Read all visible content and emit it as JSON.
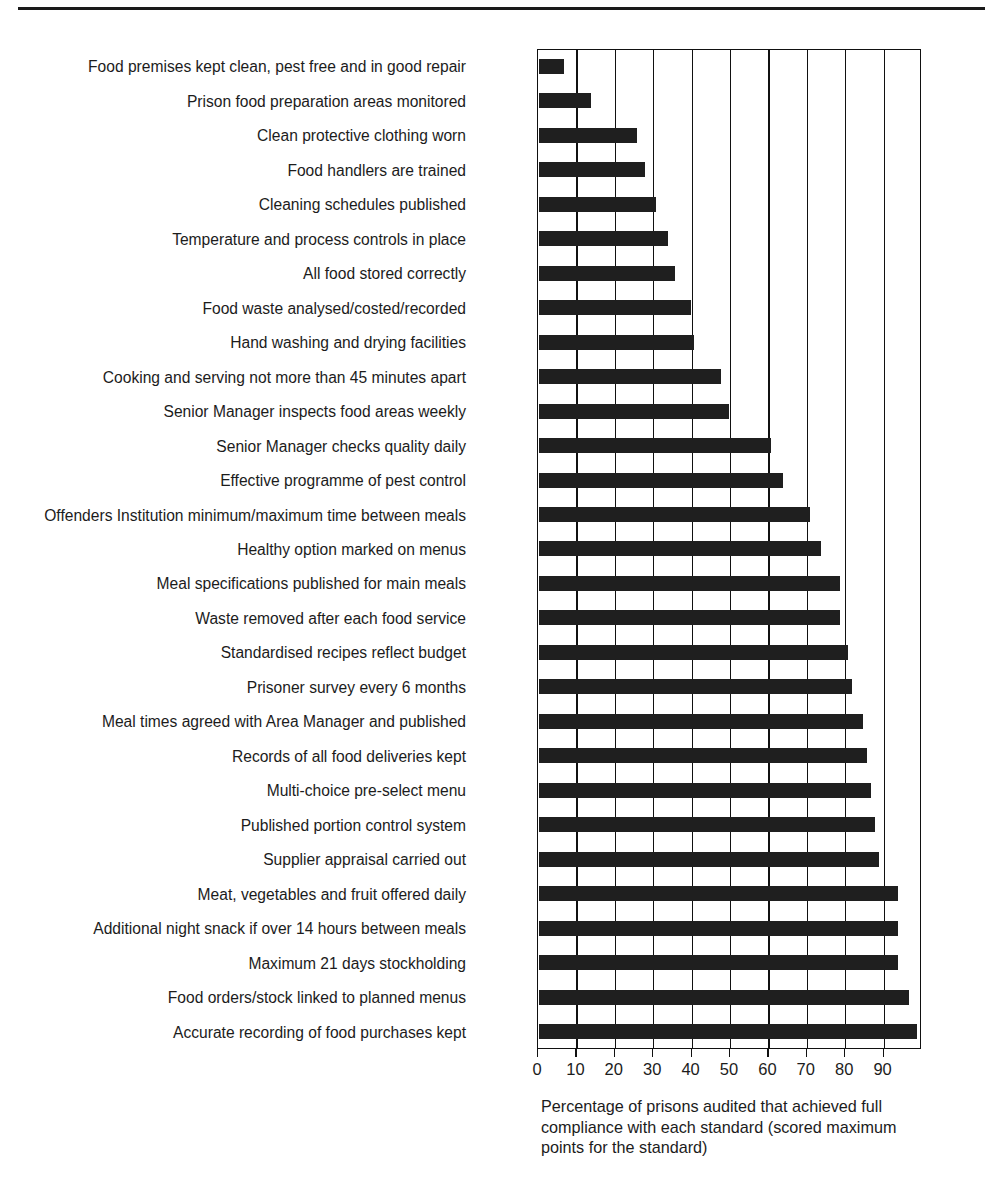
{
  "chart_data": {
    "type": "bar",
    "orientation": "horizontal",
    "title": "",
    "subtitle": "",
    "xlabel": "Percentage of prisons audited that achieved full compliance with each standard (scored maximum points for the standard)",
    "ylabel": "",
    "xlim": [
      0,
      100
    ],
    "xticks": [
      0,
      10,
      20,
      30,
      40,
      50,
      60,
      70,
      80,
      90
    ],
    "xtick_labels": [
      "0",
      "10",
      "20",
      "30",
      "40",
      "50",
      "60",
      "70",
      "80",
      "90"
    ],
    "grid": "vertical",
    "legend": "none",
    "bar_color": "#1f1f1f",
    "categories": [
      "Food premises kept clean, pest free and in good repair",
      "Prison food preparation areas monitored",
      "Clean protective clothing worn",
      "Food handlers are trained",
      "Cleaning schedules published",
      "Temperature and process controls in place",
      "All food stored correctly",
      "Food waste analysed/costed/recorded",
      "Hand washing and drying facilities",
      "Cooking and serving not more than 45 minutes apart",
      "Senior Manager inspects food areas weekly",
      "Senior Manager checks quality daily",
      "Effective programme of pest control",
      "Offenders Institution minimum/maximum time between meals",
      "Healthy option marked on menus",
      "Meal specifications published for main meals",
      "Waste removed after each food service",
      "Standardised recipes reflect budget",
      "Prisoner survey every 6 months",
      "Meal times agreed with Area Manager and published",
      "Records of all food deliveries kept",
      "Multi-choice pre-select menu",
      "Published portion control system",
      "Supplier appraisal carried out",
      "Meat, vegetables and fruit offered daily",
      "Additional night snack if over 14 hours between meals",
      "Maximum 21 days stockholding",
      "Food orders/stock linked to planned menus",
      "Accurate recording of food purchases kept"
    ],
    "values": [
      7,
      14,
      26,
      28,
      31,
      34,
      36,
      40,
      41,
      48,
      50,
      61,
      64,
      71,
      74,
      79,
      79,
      81,
      82,
      85,
      86,
      87,
      88,
      89,
      94,
      94,
      94,
      97,
      99
    ]
  },
  "caption": {
    "line1": "Percentage of prisons audited that achieved full",
    "line2": "compliance with each standard (scored maximum",
    "line3": "points for the standard)"
  }
}
